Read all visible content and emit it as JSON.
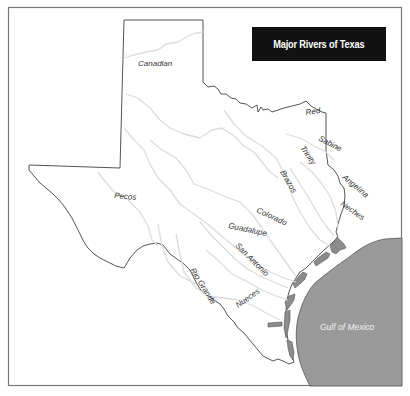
{
  "map": {
    "title": "Major Rivers of Texas",
    "colors": {
      "background": "#ffffff",
      "frame": "#666666",
      "border": "#555555",
      "river": "#dcdcdc",
      "gulf": "#9a9a9a",
      "bays": "#8c8c8c",
      "title_bg": "#111111",
      "title_text": "#ffffff",
      "label_text": "#333333",
      "gulf_label_text": "#f2f2f2"
    },
    "rivers": [
      {
        "name": "Canadian"
      },
      {
        "name": "Red"
      },
      {
        "name": "Sabine"
      },
      {
        "name": "Trinity"
      },
      {
        "name": "Brazos"
      },
      {
        "name": "Angelina"
      },
      {
        "name": "Neches"
      },
      {
        "name": "Pecos"
      },
      {
        "name": "Colorado"
      },
      {
        "name": "Guadalupe"
      },
      {
        "name": "San Antonio"
      },
      {
        "name": "Rio Grande"
      },
      {
        "name": "Nueces"
      }
    ],
    "water_bodies": [
      {
        "name": "Gulf of Mexico"
      }
    ]
  }
}
